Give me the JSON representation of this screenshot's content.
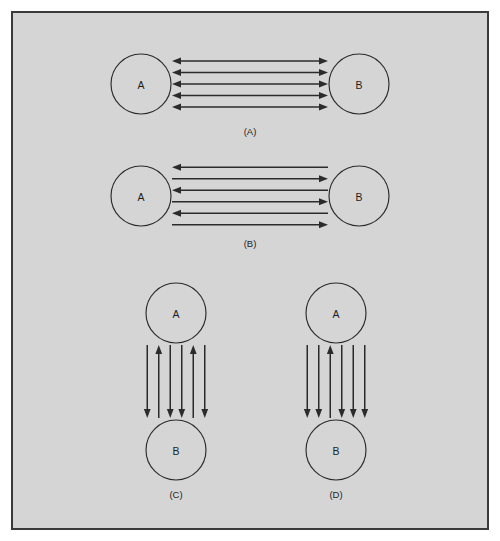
{
  "figure": {
    "background_color": "#ffffff",
    "panel_background_color": "#d5d5d5",
    "border_color": "#3a3a3a",
    "line_color": "#2b2b2b",
    "node_label_top": "A",
    "node_label_bottom": "B",
    "node_label_left": "A",
    "node_label_right": "B"
  },
  "panels": [
    {
      "id": "panel-a",
      "caption": "(A)",
      "orientation": "horizontal",
      "left_node": "A",
      "right_node": "B",
      "arrow_count": 5,
      "arrows": [
        {
          "index": 1,
          "direction": "both"
        },
        {
          "index": 2,
          "direction": "both"
        },
        {
          "index": 3,
          "direction": "both"
        },
        {
          "index": 4,
          "direction": "both"
        },
        {
          "index": 5,
          "direction": "both"
        }
      ]
    },
    {
      "id": "panel-b",
      "caption": "(B)",
      "orientation": "horizontal",
      "left_node": "A",
      "right_node": "B",
      "arrow_count": 6,
      "arrows": [
        {
          "index": 1,
          "direction": "left"
        },
        {
          "index": 2,
          "direction": "right"
        },
        {
          "index": 3,
          "direction": "left"
        },
        {
          "index": 4,
          "direction": "right"
        },
        {
          "index": 5,
          "direction": "left"
        },
        {
          "index": 6,
          "direction": "right"
        }
      ]
    },
    {
      "id": "panel-c",
      "caption": "(C)",
      "orientation": "vertical",
      "top_node": "A",
      "bottom_node": "B",
      "arrow_count": 6,
      "arrows": [
        {
          "index": 1,
          "direction": "down"
        },
        {
          "index": 2,
          "direction": "up"
        },
        {
          "index": 3,
          "direction": "down"
        },
        {
          "index": 4,
          "direction": "down"
        },
        {
          "index": 5,
          "direction": "up"
        },
        {
          "index": 6,
          "direction": "down"
        }
      ]
    },
    {
      "id": "panel-d",
      "caption": "(D)",
      "orientation": "vertical",
      "top_node": "A",
      "bottom_node": "B",
      "arrow_count": 6,
      "arrows": [
        {
          "index": 1,
          "direction": "down"
        },
        {
          "index": 2,
          "direction": "down"
        },
        {
          "index": 3,
          "direction": "up"
        },
        {
          "index": 4,
          "direction": "down"
        },
        {
          "index": 5,
          "direction": "down"
        },
        {
          "index": 6,
          "direction": "down"
        }
      ]
    }
  ]
}
